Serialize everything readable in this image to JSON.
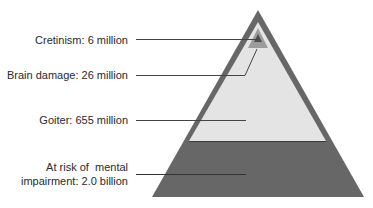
{
  "diagram": {
    "type": "pyramid",
    "levels": [
      {
        "label": "Cretinism: 6 million",
        "name": "Cretinism",
        "value": "6 million"
      },
      {
        "label": "Brain damage: 26 million",
        "name": "Brain damage",
        "value": "26 million"
      },
      {
        "label": "Goiter: 655 million",
        "name": "Goiter",
        "value": "655 million"
      },
      {
        "label_line1": "At risk of  mental",
        "label_line2": "impairment: 2.0 billion",
        "name": "At risk of mental impairment",
        "value": "2.0 billion"
      }
    ],
    "colors": {
      "outer": "#676767",
      "goiter": "#e4e4e4",
      "brain_damage": "#9c9c9c",
      "cretinism": "#4e4e4e",
      "leader_line": "#444444"
    }
  }
}
